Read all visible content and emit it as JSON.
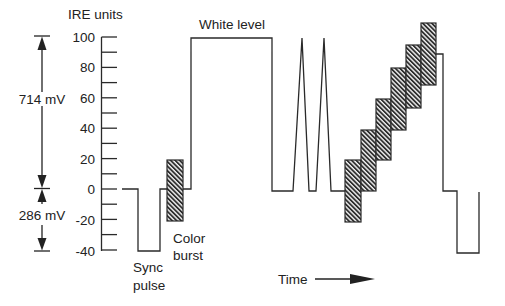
{
  "diagram": {
    "y_axis": {
      "label": "IRE units",
      "ticks": [
        {
          "value": 100,
          "label": "100"
        },
        {
          "value": 80,
          "label": "80"
        },
        {
          "value": 60,
          "label": "60"
        },
        {
          "value": 40,
          "label": "40"
        },
        {
          "value": 20,
          "label": "20"
        },
        {
          "value": 0,
          "label": "0"
        },
        {
          "value": -20,
          "label": "-20"
        },
        {
          "value": -40,
          "label": "-40"
        }
      ],
      "minor_step": 10,
      "range": [
        -40,
        100
      ]
    },
    "voltage_annotations": {
      "upper": {
        "label": "714 mV",
        "from_ire": 0,
        "to_ire": 100
      },
      "lower": {
        "label": "286 mV",
        "from_ire": -40,
        "to_ire": 0
      }
    },
    "labels": {
      "white_level": "White level",
      "sync_line1": "Sync",
      "sync_line2": "pulse",
      "burst_line1": "Color",
      "burst_line2": "burst",
      "time": "Time"
    },
    "segments": [
      {
        "name": "sync pulse",
        "level_ire": -40
      },
      {
        "name": "color burst",
        "range_ire": [
          -20,
          20
        ]
      },
      {
        "name": "white level",
        "level_ire": 100
      },
      {
        "name": "spikes",
        "count": 2,
        "peak_ire": 100
      },
      {
        "name": "modulated staircase",
        "steps": [
          {
            "center_ire": 0,
            "range_ire": [
              -20,
              20
            ]
          },
          {
            "center_ire": 20,
            "range_ire": [
              0,
              40
            ]
          },
          {
            "center_ire": 40,
            "range_ire": [
              20,
              60
            ]
          },
          {
            "center_ire": 60,
            "range_ire": [
              40,
              80
            ]
          },
          {
            "center_ire": 75,
            "range_ire": [
              55,
              95
            ]
          },
          {
            "center_ire": 90,
            "range_ire": [
              68,
              110
            ]
          }
        ]
      },
      {
        "name": "trailing level",
        "level_ire": 89
      },
      {
        "name": "next sync pulse",
        "level_ire": -40
      }
    ],
    "colors": {
      "line": "#2a2a2a",
      "hatch_fill": "#3a3a3a",
      "background": "#ffffff"
    }
  }
}
